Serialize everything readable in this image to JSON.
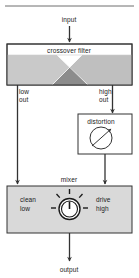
{
  "diagram": {
    "title_rule": "top-divider",
    "nodes": {
      "input": {
        "label": "input"
      },
      "crossover": {
        "label": "crossover filter"
      },
      "low_out": {
        "line1": "low",
        "line2": "out"
      },
      "high_out": {
        "line1": "high",
        "line2": "out"
      },
      "distortion": {
        "label": "distortion",
        "symbol": "adjustable-circle"
      },
      "mixer": {
        "label": "mixer",
        "left_line1": "clean",
        "left_line2": "low",
        "right_line1": "drive",
        "right_line2": "high",
        "control": "rotary-knob"
      },
      "output": {
        "label": "output"
      }
    },
    "icons": {
      "arrow_down": "arrow-down-icon",
      "knob": "rotary-knob-icon",
      "distortion_symbol": "variable-attenuator-icon"
    },
    "colors": {
      "stroke": "#333333",
      "block_fill": "#d9d9d9",
      "block_header_fill": "#ffffff",
      "lowpass_fill": "#c8c8c8",
      "highpass_fill": "#bdbdbd",
      "overlap_fill": "#8a8a8a",
      "knob_fill": "#ffffff",
      "text": "#1a1a1a",
      "background": "#ffffff"
    }
  }
}
